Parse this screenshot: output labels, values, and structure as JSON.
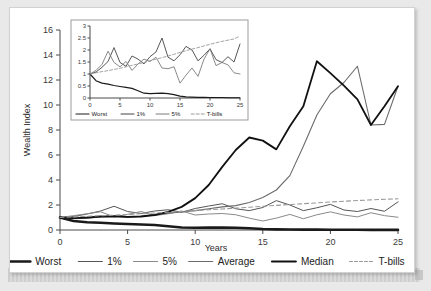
{
  "figure": {
    "background_color": "#e9e9e9",
    "card_color": "#ffffff",
    "border_color": "#d2d2d2"
  },
  "chart_data": {
    "type": "line",
    "title": "",
    "xlabel": "Years",
    "ylabel": "Wealth Index",
    "xlim": [
      0,
      25
    ],
    "ylim": [
      0,
      16
    ],
    "xticks": [
      "0",
      "5",
      "10",
      "15",
      "20",
      "25"
    ],
    "yticks": [
      "0",
      "2",
      "4",
      "6",
      "8",
      "10",
      "12",
      "14",
      "16"
    ],
    "grid": false,
    "legend_position": "bottom",
    "x": [
      0,
      1,
      2,
      3,
      4,
      5,
      6,
      7,
      8,
      9,
      10,
      11,
      12,
      13,
      14,
      15,
      16,
      17,
      18,
      19,
      20,
      21,
      22,
      23,
      24,
      25
    ],
    "series": [
      {
        "name": "Worst",
        "color": "#1a1a1a",
        "width": 2.6,
        "dash": "none",
        "values": [
          1.0,
          0.72,
          0.62,
          0.58,
          0.52,
          0.48,
          0.44,
          0.4,
          0.3,
          0.2,
          0.18,
          0.19,
          0.2,
          0.18,
          0.14,
          0.08,
          0.05,
          0.04,
          0.03,
          0.03,
          0.02,
          0.02,
          0.02,
          0.01,
          0.01,
          0.01
        ]
      },
      {
        "name": "1%",
        "color": "#555555",
        "width": 1.0,
        "dash": "none",
        "values": [
          1.0,
          1.08,
          1.28,
          1.52,
          1.9,
          1.48,
          1.32,
          1.52,
          1.62,
          1.42,
          1.72,
          1.92,
          2.1,
          1.7,
          1.55,
          1.8,
          2.35,
          2.0,
          1.55,
          1.78,
          2.05,
          1.6,
          1.48,
          1.72,
          1.5,
          2.25
        ]
      },
      {
        "name": "5%",
        "color": "#8a8a8a",
        "width": 1.0,
        "dash": "none",
        "values": [
          1.0,
          1.15,
          1.3,
          1.46,
          1.05,
          1.25,
          1.48,
          1.15,
          1.3,
          1.52,
          1.2,
          1.28,
          1.32,
          1.22,
          0.95,
          0.72,
          0.95,
          1.25,
          0.9,
          1.22,
          1.45,
          1.2,
          1.05,
          1.38,
          1.15,
          1.02
        ]
      },
      {
        "name": "Average",
        "color": "#6b6b6b",
        "width": 1.1,
        "dash": "none",
        "values": [
          1.0,
          0.9,
          0.95,
          1.05,
          1.12,
          1.0,
          1.1,
          1.22,
          1.35,
          1.45,
          1.55,
          1.7,
          1.85,
          1.95,
          2.2,
          2.6,
          3.2,
          4.35,
          6.7,
          9.2,
          10.9,
          11.8,
          13.1,
          8.4,
          8.45,
          11.5
        ]
      },
      {
        "name": "Median",
        "color": "#111111",
        "width": 1.8,
        "dash": "none",
        "values": [
          1.0,
          0.95,
          1.0,
          1.08,
          1.1,
          1.05,
          1.08,
          1.2,
          1.45,
          1.85,
          2.55,
          3.6,
          5.05,
          6.4,
          7.4,
          7.15,
          6.45,
          8.3,
          9.9,
          13.5,
          12.55,
          11.55,
          10.45,
          8.4,
          9.9,
          11.5
        ]
      },
      {
        "name": "T-bills",
        "color": "#9a9a9a",
        "width": 1.1,
        "dash": "4 3",
        "values": [
          1.0,
          1.05,
          1.1,
          1.14,
          1.19,
          1.24,
          1.3,
          1.36,
          1.42,
          1.48,
          1.55,
          1.62,
          1.68,
          1.75,
          1.82,
          1.9,
          1.97,
          2.04,
          2.1,
          2.17,
          2.24,
          2.3,
          2.36,
          2.41,
          2.46,
          2.5
        ]
      }
    ],
    "legend": [
      {
        "label": "Worst",
        "color": "#1a1a1a",
        "width": 2.6,
        "dash": "none"
      },
      {
        "label": "1%",
        "color": "#555555",
        "width": 1.2,
        "dash": "none"
      },
      {
        "label": "5%",
        "color": "#8a8a8a",
        "width": 1.2,
        "dash": "none"
      },
      {
        "label": "Average",
        "color": "#6b6b6b",
        "width": 1.2,
        "dash": "none"
      },
      {
        "label": "Median",
        "color": "#111111",
        "width": 1.9,
        "dash": "none"
      },
      {
        "label": "T-bills",
        "color": "#9a9a9a",
        "width": 1.2,
        "dash": "3 2"
      }
    ],
    "inset": {
      "type": "line",
      "xlim": [
        0,
        25
      ],
      "ylim": [
        0,
        3
      ],
      "xticks": [
        "0",
        "5",
        "10",
        "15",
        "20",
        "25"
      ],
      "yticks": [
        "0",
        "0.5",
        "1",
        "1.5",
        "2",
        "2.5",
        "3"
      ],
      "x": [
        0,
        1,
        2,
        3,
        4,
        5,
        6,
        7,
        8,
        9,
        10,
        11,
        12,
        13,
        14,
        15,
        16,
        17,
        18,
        19,
        20,
        21,
        22,
        23,
        24,
        25
      ],
      "series": [
        {
          "name": "Worst",
          "color": "#1a1a1a",
          "width": 1.2,
          "dash": "none",
          "values": [
            1.0,
            0.72,
            0.62,
            0.58,
            0.52,
            0.48,
            0.44,
            0.4,
            0.3,
            0.2,
            0.18,
            0.19,
            0.2,
            0.18,
            0.14,
            0.08,
            0.05,
            0.04,
            0.03,
            0.03,
            0.02,
            0.02,
            0.02,
            0.01,
            0.01,
            0.01
          ]
        },
        {
          "name": "1%",
          "color": "#444444",
          "width": 0.9,
          "dash": "none",
          "values": [
            1.0,
            1.08,
            1.28,
            1.52,
            2.1,
            1.48,
            1.32,
            1.75,
            1.62,
            1.42,
            1.72,
            1.92,
            2.5,
            1.7,
            1.55,
            1.8,
            2.15,
            2.0,
            1.55,
            1.78,
            2.05,
            1.6,
            1.48,
            1.72,
            1.5,
            2.25
          ]
        },
        {
          "name": "5%",
          "color": "#7d7d7d",
          "width": 0.9,
          "dash": "none",
          "values": [
            1.0,
            1.15,
            1.4,
            1.95,
            1.48,
            1.3,
            1.52,
            1.15,
            1.42,
            1.62,
            1.52,
            1.7,
            1.25,
            1.22,
            1.3,
            0.62,
            0.95,
            1.25,
            0.9,
            1.62,
            2.05,
            1.35,
            1.48,
            1.38,
            1.05,
            1.0
          ]
        },
        {
          "name": "T-bills",
          "color": "#9a9a9a",
          "width": 0.9,
          "dash": "3 2",
          "values": [
            1.0,
            1.05,
            1.1,
            1.14,
            1.19,
            1.24,
            1.3,
            1.36,
            1.42,
            1.48,
            1.55,
            1.62,
            1.68,
            1.75,
            1.82,
            1.9,
            1.97,
            2.04,
            2.1,
            2.17,
            2.24,
            2.3,
            2.36,
            2.41,
            2.46,
            2.58
          ]
        }
      ],
      "legend": [
        {
          "label": "Worst",
          "color": "#1a1a1a",
          "width": 1.2,
          "dash": "none"
        },
        {
          "label": "1%",
          "color": "#444444",
          "width": 1.0,
          "dash": "none"
        },
        {
          "label": "5%",
          "color": "#7d7d7d",
          "width": 1.0,
          "dash": "none"
        },
        {
          "label": "T-bills",
          "color": "#9a9a9a",
          "width": 1.0,
          "dash": "3 2"
        }
      ]
    }
  }
}
